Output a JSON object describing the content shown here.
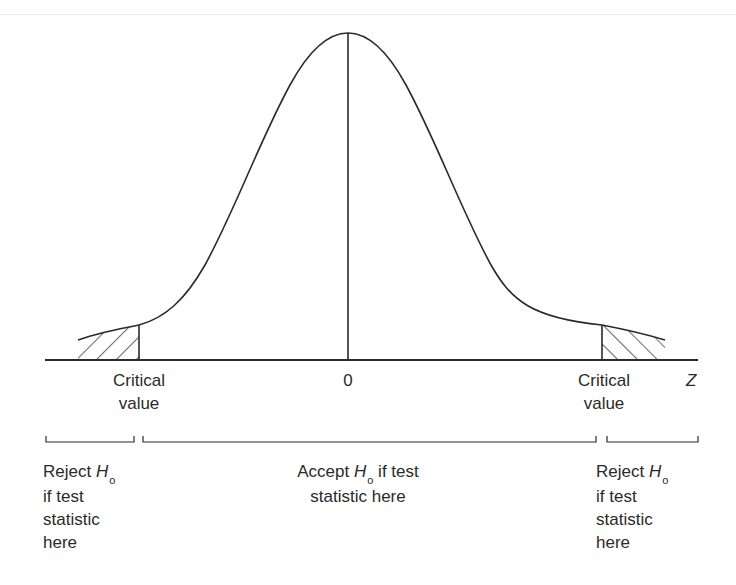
{
  "diagram": {
    "type": "normal-distribution-hypothesis-test",
    "axis_label": "Z",
    "center_label": "0",
    "critical_left": {
      "line1": "Critical",
      "line2": "value"
    },
    "critical_right": {
      "line1": "Critical",
      "line2": "value"
    },
    "regions": {
      "reject_left": {
        "prefix": "Reject ",
        "symbol": "H",
        "subscript": "o",
        "line2": "if test",
        "line3": "statistic",
        "line4": "here"
      },
      "accept": {
        "prefix": "Accept ",
        "symbol": "H",
        "subscript": "o",
        "suffix": " if test",
        "line2": "statistic here"
      },
      "reject_right": {
        "prefix": "Reject ",
        "symbol": "H",
        "subscript": "o",
        "line2": "if test",
        "line3": "statistic",
        "line4": "here"
      }
    },
    "colors": {
      "stroke": "#2a2a2a",
      "background": "#ffffff"
    }
  }
}
